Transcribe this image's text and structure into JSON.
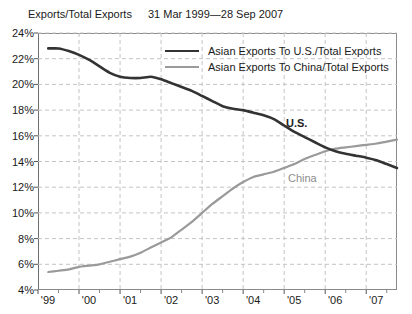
{
  "header": {
    "y_axis_title": "Exports/Total Exports",
    "date_range": "31 Mar 1999—28 Sep 2007"
  },
  "legend": {
    "position": "inside-top-right",
    "entries": [
      {
        "label": "Asian Exports To U.S./Total Exports",
        "color": "#333333",
        "width": 2.6
      },
      {
        "label": "Asian Exports To China/Total Exports",
        "color": "#9a9a9a",
        "width": 2.2
      }
    ]
  },
  "annotations": [
    {
      "name": "us",
      "text": "U.S.",
      "color": "#222222"
    },
    {
      "name": "china",
      "text": "China",
      "color": "#8d8d8d"
    }
  ],
  "axes": {
    "y_ticks": [
      "24%",
      "22%",
      "20%",
      "18%",
      "16%",
      "14%",
      "12%",
      "10%",
      "8%",
      "6%",
      "4%"
    ],
    "x_ticks": [
      "'99",
      "'00",
      "'01",
      "'02",
      "'03",
      "'04",
      "'05",
      "'06",
      "'07"
    ]
  },
  "chart_data": {
    "type": "line",
    "title": "",
    "subtitle": "31 Mar 1999—28 Sep 2007",
    "xlabel": "",
    "ylabel": "Exports/Total Exports",
    "xlim": [
      1999.0,
      2007.75
    ],
    "ylim": [
      4,
      24
    ],
    "y_tick_values": [
      4,
      6,
      8,
      10,
      12,
      14,
      16,
      18,
      20,
      22,
      24
    ],
    "x_tick_values": [
      1999,
      2000,
      2001,
      2002,
      2003,
      2004,
      2005,
      2006,
      2007
    ],
    "x_tick_labels": [
      "'99",
      "'00",
      "'01",
      "'02",
      "'03",
      "'04",
      "'05",
      "'06",
      "'07"
    ],
    "y_unit": "percent",
    "grid": "dashed-both-axes",
    "minor_x_ticks": "mid-year",
    "legend_position": "inside-top-right",
    "series": [
      {
        "name": "Asian Exports To U.S./Total Exports",
        "short_name": "U.S.",
        "color": "#333333",
        "x": [
          1999.25,
          1999.5,
          1999.75,
          2000.0,
          2000.25,
          2000.5,
          2000.75,
          2001.0,
          2001.25,
          2001.5,
          2001.75,
          2002.0,
          2002.25,
          2002.5,
          2002.75,
          2003.0,
          2003.25,
          2003.5,
          2003.75,
          2004.0,
          2004.25,
          2004.5,
          2004.75,
          2005.0,
          2005.25,
          2005.5,
          2005.75,
          2006.0,
          2006.25,
          2006.5,
          2006.75,
          2007.0,
          2007.25,
          2007.5,
          2007.75
        ],
        "values": [
          22.8,
          22.8,
          22.6,
          22.3,
          21.9,
          21.4,
          20.9,
          20.6,
          20.5,
          20.5,
          20.6,
          20.4,
          20.1,
          19.8,
          19.5,
          19.1,
          18.7,
          18.3,
          18.1,
          18.0,
          17.8,
          17.6,
          17.3,
          16.8,
          16.3,
          15.9,
          15.5,
          15.1,
          14.8,
          14.6,
          14.45,
          14.3,
          14.1,
          13.8,
          13.5
        ]
      },
      {
        "name": "Asian Exports To China/Total Exports",
        "short_name": "China",
        "color": "#9a9a9a",
        "x": [
          1999.25,
          1999.5,
          1999.75,
          2000.0,
          2000.25,
          2000.5,
          2000.75,
          2001.0,
          2001.25,
          2001.5,
          2001.75,
          2002.0,
          2002.25,
          2002.5,
          2002.75,
          2003.0,
          2003.25,
          2003.5,
          2003.75,
          2004.0,
          2004.25,
          2004.5,
          2004.75,
          2005.0,
          2005.25,
          2005.5,
          2005.75,
          2006.0,
          2006.25,
          2006.5,
          2006.75,
          2007.0,
          2007.25,
          2007.5,
          2007.75
        ],
        "values": [
          5.4,
          5.5,
          5.6,
          5.8,
          5.9,
          6.0,
          6.2,
          6.4,
          6.6,
          6.9,
          7.3,
          7.7,
          8.1,
          8.7,
          9.3,
          10.0,
          10.7,
          11.3,
          11.9,
          12.4,
          12.8,
          13.0,
          13.2,
          13.5,
          13.8,
          14.2,
          14.5,
          14.8,
          15.0,
          15.1,
          15.2,
          15.3,
          15.4,
          15.55,
          15.7
        ]
      }
    ],
    "crossover": {
      "x": 2005.4,
      "y": 14.6,
      "note": "China series overtakes U.S. series"
    }
  },
  "colors": {
    "us_line": "#333333",
    "china_line": "#9a9a9a",
    "grid": "#c4c4c4",
    "frame": "#8a8a8a",
    "background": "#ffffff",
    "text": "#1a1a1a"
  }
}
